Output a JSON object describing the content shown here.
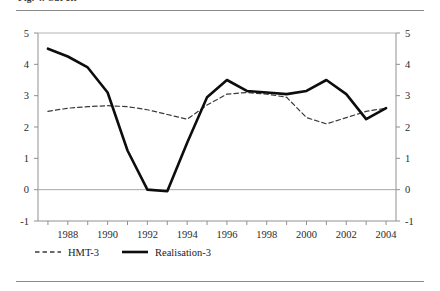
{
  "figure": {
    "clipped_caption": "Fig. 4. Cut off"
  },
  "chart_data": {
    "type": "line",
    "title": "",
    "subtitle": "",
    "xlabel": "",
    "ylabel": "",
    "x": [
      1987,
      1988,
      1989,
      1990,
      1991,
      1992,
      1993,
      1994,
      1995,
      1996,
      1997,
      1998,
      1999,
      2000,
      2001,
      2002,
      2003,
      2004
    ],
    "xlim": [
      1986.5,
      2004.5
    ],
    "ylim": [
      -1,
      5
    ],
    "yticks": [
      -1,
      0,
      1,
      2,
      3,
      4,
      5
    ],
    "ytick_labels": [
      "-1",
      "0",
      "1",
      "2",
      "3",
      "4",
      "5"
    ],
    "xticks": [
      1987,
      1988,
      1989,
      1990,
      1991,
      1992,
      1993,
      1994,
      1995,
      1996,
      1997,
      1998,
      1999,
      2000,
      2001,
      2002,
      2003,
      2004
    ],
    "xtick_labels": [
      "",
      "1988",
      "",
      "1990",
      "",
      "1992",
      "",
      "1994",
      "",
      "1996",
      "",
      "1998",
      "",
      "2000",
      "",
      "2002",
      "",
      "2004"
    ],
    "y_axis_right": true,
    "ytick_labels_right": [
      "-1",
      "0",
      "1",
      "2",
      "3",
      "4",
      "5"
    ],
    "grid": false,
    "zero_line": true,
    "legend_position": "bottom-left",
    "series": [
      {
        "name": "HMT-3",
        "style": "dashed",
        "color": "#3a3a3a",
        "width": 1.2,
        "values": [
          2.5,
          2.6,
          2.65,
          2.68,
          2.65,
          2.55,
          2.4,
          2.25,
          2.7,
          3.05,
          3.1,
          3.05,
          2.95,
          2.3,
          2.1,
          2.3,
          2.5,
          2.6
        ]
      },
      {
        "name": "Realisation-3",
        "style": "solid",
        "color": "#0d0d0d",
        "width": 2.6,
        "values": [
          4.5,
          4.25,
          3.9,
          3.1,
          1.25,
          0.0,
          -0.05,
          1.5,
          2.95,
          3.5,
          3.15,
          3.1,
          3.05,
          3.15,
          3.5,
          3.05,
          2.25,
          2.6
        ]
      }
    ]
  }
}
